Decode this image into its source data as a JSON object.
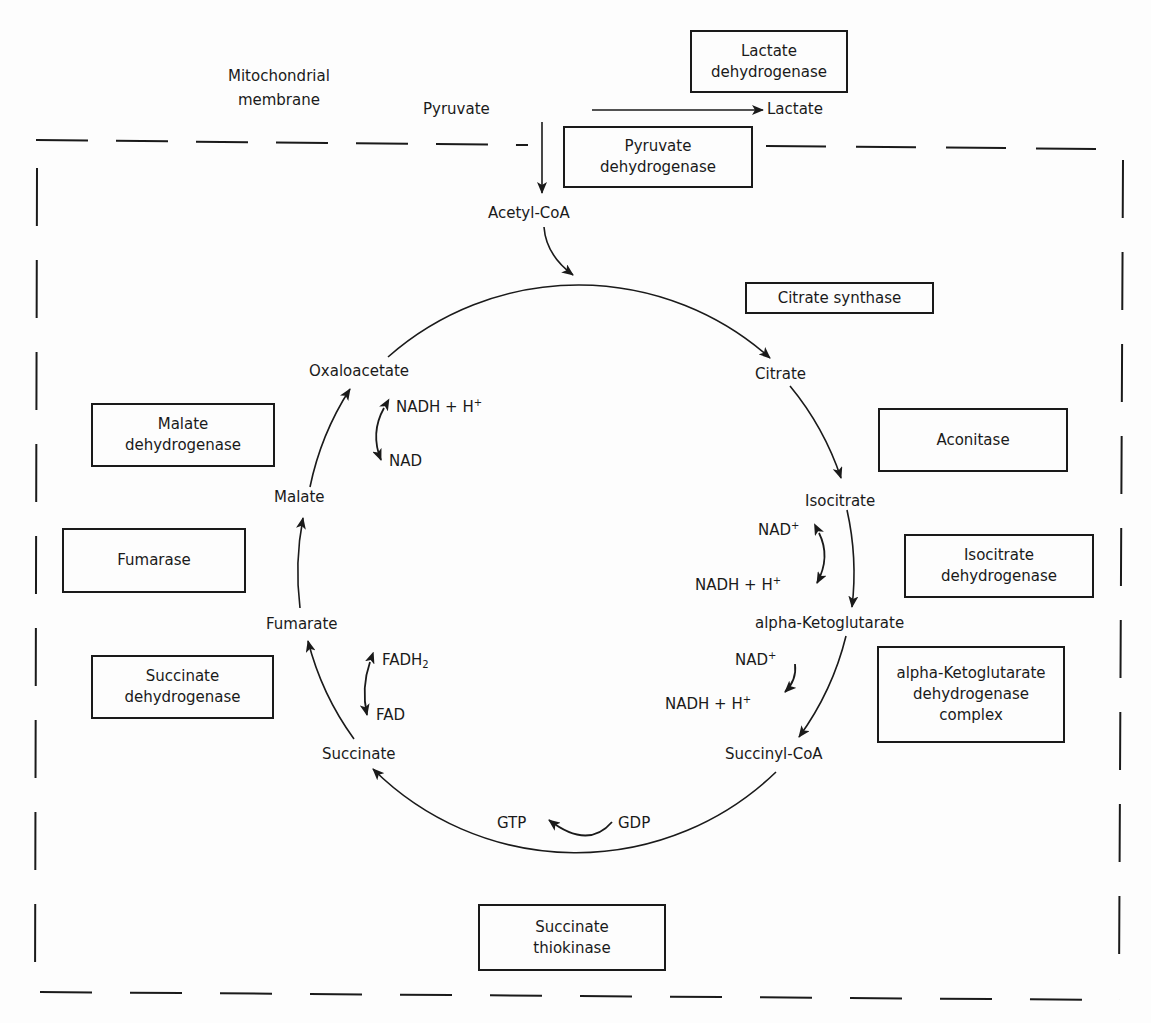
{
  "membrane_label": [
    "Mitochondrial",
    "membrane"
  ],
  "outside": {
    "pyruvate": "Pyruvate",
    "lactate": "Lactate",
    "acetyl_coa": "Acetyl-CoA"
  },
  "intermediates": {
    "citrate": "Citrate",
    "isocitrate": "Isocitrate",
    "alpha_ketoglutarate": "alpha-Ketoglutarate",
    "succinyl_coa": "Succinyl-CoA",
    "succinate": "Succinate",
    "fumarate": "Fumarate",
    "malate": "Malate",
    "oxaloacetate": "Oxaloacetate"
  },
  "cofactors": {
    "isocitrate_in": "NAD",
    "isocitrate_in_sup": "+",
    "isocitrate_out": "NADH + H",
    "isocitrate_out_sup": "+",
    "akg_in": "NAD",
    "akg_in_sup": "+",
    "akg_out": "NADH + H",
    "akg_out_sup": "+",
    "gdp": "GDP",
    "gtp": "GTP",
    "fadh2": "FADH",
    "fadh2_sub": "2",
    "fad": "FAD",
    "malate_nadh": "NADH + H",
    "malate_nadh_sup": "+",
    "malate_nad": "NAD"
  },
  "enzymes": {
    "lactate_dehydrogenase": [
      "Lactate",
      "dehydrogenase"
    ],
    "pyruvate_dehydrogenase": [
      "Pyruvate",
      "dehydrogenase"
    ],
    "citrate_synthase": [
      "Citrate synthase"
    ],
    "aconitase": [
      "Aconitase"
    ],
    "isocitrate_dehydrogenase": [
      "Isocitrate",
      "dehydrogenase"
    ],
    "akg_dehydrogenase_complex": [
      "alpha-Ketoglutarate",
      "dehydrogenase",
      "complex"
    ],
    "succinate_thiokinase": [
      "Succinate",
      "thiokinase"
    ],
    "succinate_dehydrogenase": [
      "Succinate",
      "dehydrogenase"
    ],
    "fumarase": [
      "Fumarase"
    ],
    "malate_dehydrogenase": [
      "Malate",
      "dehydrogenase"
    ]
  },
  "colors": {
    "ink": "#1a1a1a",
    "background": "#fdfdfd"
  }
}
